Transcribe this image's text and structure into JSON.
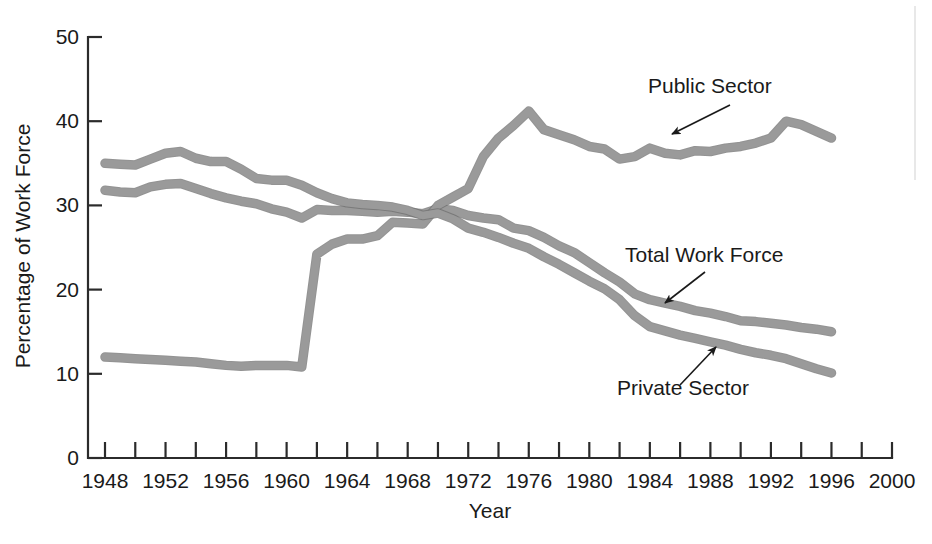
{
  "chart_data": {
    "type": "line",
    "title": "",
    "xlabel": "Year",
    "ylabel": "Percentage of Work Force",
    "xlim": [
      1948,
      2000
    ],
    "ylim": [
      0,
      50
    ],
    "grid": false,
    "legend_position": "inline-annotations",
    "xticks": [
      1948,
      1952,
      1956,
      1960,
      1964,
      1968,
      1972,
      1976,
      1980,
      1984,
      1988,
      1992,
      1996,
      2000
    ],
    "xtick_labels": [
      "1948",
      "1952",
      "1956",
      "1960",
      "1964",
      "1968",
      "1972",
      "1976",
      "1980",
      "1984",
      "1988",
      "1992",
      "1996",
      "2000"
    ],
    "xminor_ticks": [
      1950,
      1954,
      1958,
      1962,
      1966,
      1970,
      1974,
      1978,
      1982,
      1986,
      1990,
      1994,
      1998
    ],
    "yticks": [
      0,
      10,
      20,
      30,
      40,
      50
    ],
    "ytick_labels": [
      "0",
      "10",
      "20",
      "30",
      "40",
      "50"
    ],
    "x": [
      1948,
      1949,
      1950,
      1951,
      1952,
      1953,
      1954,
      1955,
      1956,
      1957,
      1958,
      1959,
      1960,
      1961,
      1962,
      1963,
      1964,
      1965,
      1966,
      1967,
      1968,
      1969,
      1970,
      1971,
      1972,
      1973,
      1974,
      1975,
      1976,
      1977,
      1978,
      1979,
      1980,
      1981,
      1982,
      1983,
      1984,
      1985,
      1986,
      1987,
      1988,
      1989,
      1990,
      1991,
      1992,
      1993,
      1994,
      1995,
      1996
    ],
    "series": [
      {
        "name": "Total Work Force",
        "color": "#9a9a9a",
        "annotation": "Total Work Force",
        "values": [
          31.8,
          31.6,
          31.5,
          32.2,
          32.5,
          32.6,
          32.0,
          31.4,
          30.9,
          30.5,
          30.2,
          29.6,
          29.2,
          28.5,
          29.5,
          29.4,
          29.4,
          29.3,
          29.2,
          29.3,
          29.2,
          29.0,
          29.6,
          29.4,
          28.8,
          28.5,
          28.3,
          27.3,
          27.0,
          26.2,
          25.2,
          24.4,
          23.2,
          22.0,
          20.9,
          19.5,
          18.8,
          18.4,
          18.0,
          17.5,
          17.2,
          16.8,
          16.3,
          16.2,
          16.0,
          15.8,
          15.5,
          15.3,
          15.0
        ]
      },
      {
        "name": "Public Sector",
        "color": "#9a9a9a",
        "annotation": "Public Sector",
        "values": [
          12.0,
          11.9,
          11.8,
          11.7,
          11.6,
          11.5,
          11.4,
          11.2,
          11.0,
          10.9,
          11.0,
          11.0,
          11.0,
          10.8,
          24.2,
          25.4,
          26.0,
          26.0,
          26.4,
          28.0,
          27.9,
          27.8,
          30.0,
          31.0,
          32.0,
          35.8,
          38.0,
          39.5,
          41.2,
          39.0,
          38.4,
          37.8,
          37.0,
          36.7,
          35.5,
          35.8,
          36.8,
          36.2,
          36.0,
          36.5,
          36.4,
          36.8,
          37.0,
          37.4,
          38.0,
          40.0,
          39.6,
          38.8,
          38.0
        ]
      },
      {
        "name": "Private Sector",
        "color": "#9a9a9a",
        "annotation": "Private Sector",
        "values": [
          35.0,
          34.9,
          34.8,
          35.5,
          36.2,
          36.4,
          35.6,
          35.2,
          35.2,
          34.3,
          33.2,
          33.0,
          33.0,
          32.4,
          31.5,
          30.8,
          30.3,
          30.1,
          30.0,
          29.8,
          29.4,
          28.8,
          29.1,
          28.4,
          27.3,
          26.8,
          26.2,
          25.5,
          24.9,
          23.9,
          23.0,
          22.0,
          21.0,
          20.1,
          18.8,
          16.9,
          15.6,
          15.1,
          14.6,
          14.2,
          13.8,
          13.4,
          12.9,
          12.5,
          12.2,
          11.8,
          11.2,
          10.6,
          10.1
        ]
      }
    ],
    "annotations": [
      {
        "label": "Public Sector",
        "text_x": 648,
        "text_y": 93,
        "arrow_from_x": 730,
        "arrow_from_y": 105,
        "arrow_to_x": 672,
        "arrow_to_y": 134
      },
      {
        "label": "Total Work Force",
        "text_x": 625,
        "text_y": 262,
        "arrow_from_x": 705,
        "arrow_from_y": 272,
        "arrow_to_x": 665,
        "arrow_to_y": 303
      },
      {
        "label": "Private Sector",
        "text_x": 617,
        "text_y": 395,
        "arrow_from_x": 680,
        "arrow_from_y": 385,
        "arrow_to_x": 716,
        "arrow_to_y": 347
      }
    ]
  },
  "axes": {
    "y_axis_title": "Percentage of Work Force",
    "x_axis_title": "Year"
  }
}
